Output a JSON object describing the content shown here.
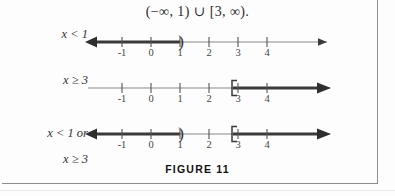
{
  "figure": {
    "interval_expression": "(−∞, 1) ∪ [3, ∞).",
    "caption": "FIGURE 11",
    "axis": {
      "tick_values": [
        "-1",
        "0",
        "1",
        "2",
        "3",
        "4"
      ],
      "left_arrow_color": "#2e2e2e",
      "line_color": "#7a7a7a",
      "shaded_color": "#3a3a3a"
    },
    "lines": [
      {
        "label": "x < 1",
        "label_lines": [
          "x < 1"
        ],
        "shaded_from": "-infinity",
        "shaded_to": "1",
        "left_endpoint_symbol": "arrow",
        "right_endpoint_symbol": ")",
        "right_endpoint_value": "1",
        "has_left_arrow": true,
        "has_right_arrow": true
      },
      {
        "label": "x ≥ 3",
        "label_lines": [
          "x ≥ 3"
        ],
        "shaded_from": "3",
        "shaded_to": "infinity",
        "left_endpoint_symbol": "[",
        "left_endpoint_value": "3",
        "right_endpoint_symbol": "arrow",
        "has_left_arrow": false,
        "has_right_arrow": true
      },
      {
        "label": "x < 1 or x ≥ 3",
        "label_lines": [
          "x < 1 or",
          "x ≥ 3"
        ],
        "shaded_from": "-infinity",
        "shaded_to": "1",
        "shaded_from_2": "3",
        "shaded_to_2": "infinity",
        "left_endpoint_symbol": "arrow",
        "right_endpoint_symbol": "arrow",
        "bracket_at": "3",
        "paren_at": "1",
        "has_left_arrow": true,
        "has_right_arrow": true
      }
    ]
  }
}
